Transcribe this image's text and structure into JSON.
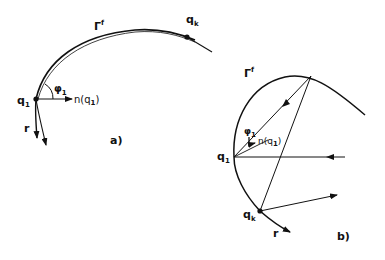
{
  "figure": {
    "panel_a": {
      "caption": "a)",
      "curve_label": "Γ",
      "curve_label_sup": "f",
      "point_start": "q",
      "point_start_sub": "1",
      "point_end": "q",
      "point_end_sub": "k",
      "angle_label": "φ",
      "angle_label_sub": "1",
      "normal_label": "n(q",
      "normal_label_sub": "1",
      "normal_label_close": ")",
      "ray_label": "r"
    },
    "panel_b": {
      "caption": "b)",
      "curve_label": "Γ",
      "curve_label_sup": "f",
      "point_start": "q",
      "point_start_sub": "1",
      "point_end": "q",
      "point_end_sub": "k",
      "angle_label": "φ",
      "angle_label_sub": "1",
      "normal_label": "n(q",
      "normal_label_sub": "1",
      "normal_label_close": ")",
      "ray_label": "r"
    },
    "colors": {
      "ink": "#111111",
      "background": "#ffffff"
    }
  }
}
